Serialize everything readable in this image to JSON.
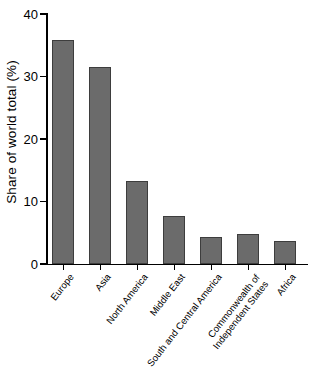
{
  "chart_data": {
    "type": "bar",
    "title": "",
    "xlabel": "",
    "ylabel": "Share of world total (%)",
    "categories": [
      "Europe",
      "Asia",
      "North America",
      "Middle East",
      "South and Central America",
      "Commonwealth of Independent States",
      "Africa"
    ],
    "values": [
      35.8,
      31.5,
      13.3,
      7.7,
      4.4,
      4.8,
      3.7
    ],
    "ylim": [
      0,
      40
    ],
    "yticks": [
      0,
      10,
      20,
      30,
      40
    ],
    "ytick_labels": [
      "0",
      "10",
      "20",
      "30",
      "40"
    ],
    "grid": false,
    "legend": false,
    "bar_color": "#6b6b6b",
    "bar_edge_color": "#3d3d3d",
    "axis_color": "#000000"
  },
  "axis": {
    "y_title": "Share of world total (%)",
    "ticks": [
      {
        "label": "40",
        "value": 40
      },
      {
        "label": "30",
        "value": 30
      },
      {
        "label": "20",
        "value": 20
      },
      {
        "label": "10",
        "value": 10
      },
      {
        "label": "0",
        "value": 0
      }
    ]
  },
  "bars": [
    {
      "label": "Europe",
      "value": 35.8,
      "label_line1": "Europe",
      "label_line2": ""
    },
    {
      "label": "Asia",
      "value": 31.5,
      "label_line1": "Asia",
      "label_line2": ""
    },
    {
      "label": "North America",
      "value": 13.3,
      "label_line1": "North America",
      "label_line2": ""
    },
    {
      "label": "Middle East",
      "value": 7.7,
      "label_line1": "Middle East",
      "label_line2": ""
    },
    {
      "label": "South and Central America",
      "value": 4.4,
      "label_line1": "South and Central America",
      "label_line2": ""
    },
    {
      "label": "Commonwealth of Independent States",
      "value": 4.8,
      "label_line1": "Commonwealth of",
      "label_line2": "Independent States"
    },
    {
      "label": "Africa",
      "value": 3.7,
      "label_line1": "Africa",
      "label_line2": ""
    }
  ]
}
